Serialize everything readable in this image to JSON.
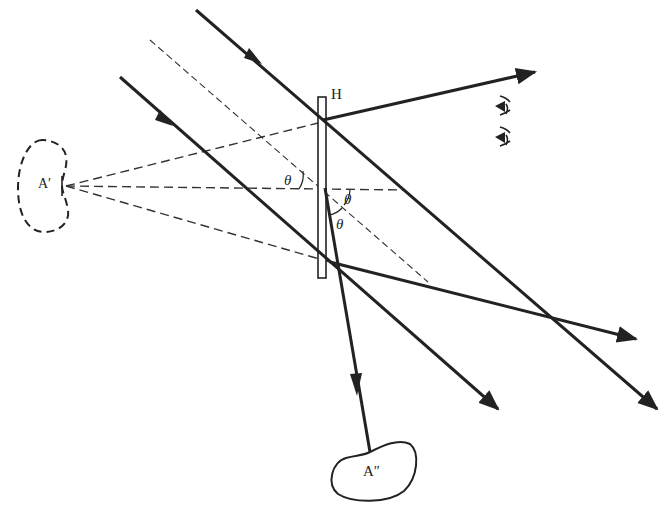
{
  "diagram": {
    "type": "holographic-reconstruction-ray-diagram",
    "colors": {
      "ink": "#222222",
      "background": "#ffffff"
    },
    "labels": {
      "hologram": "H",
      "virtual_image": "A′",
      "real_image": "A″",
      "angle_1": "θ",
      "angle_2": "θ",
      "angle_3": "θ"
    },
    "elements": {
      "hologram_plate": "vertical hologram plate",
      "virtual_image_outline": "dashed bean-shaped virtual image",
      "real_image_outline": "solid bean-shaped real image",
      "observer_eyes": "two eye symbols",
      "reference_beams": "parallel incident reconstruction beams with arrows",
      "diffracted_beams": "diffracted output beams with arrows",
      "construction_lines": "dashed construction lines from A′"
    }
  }
}
